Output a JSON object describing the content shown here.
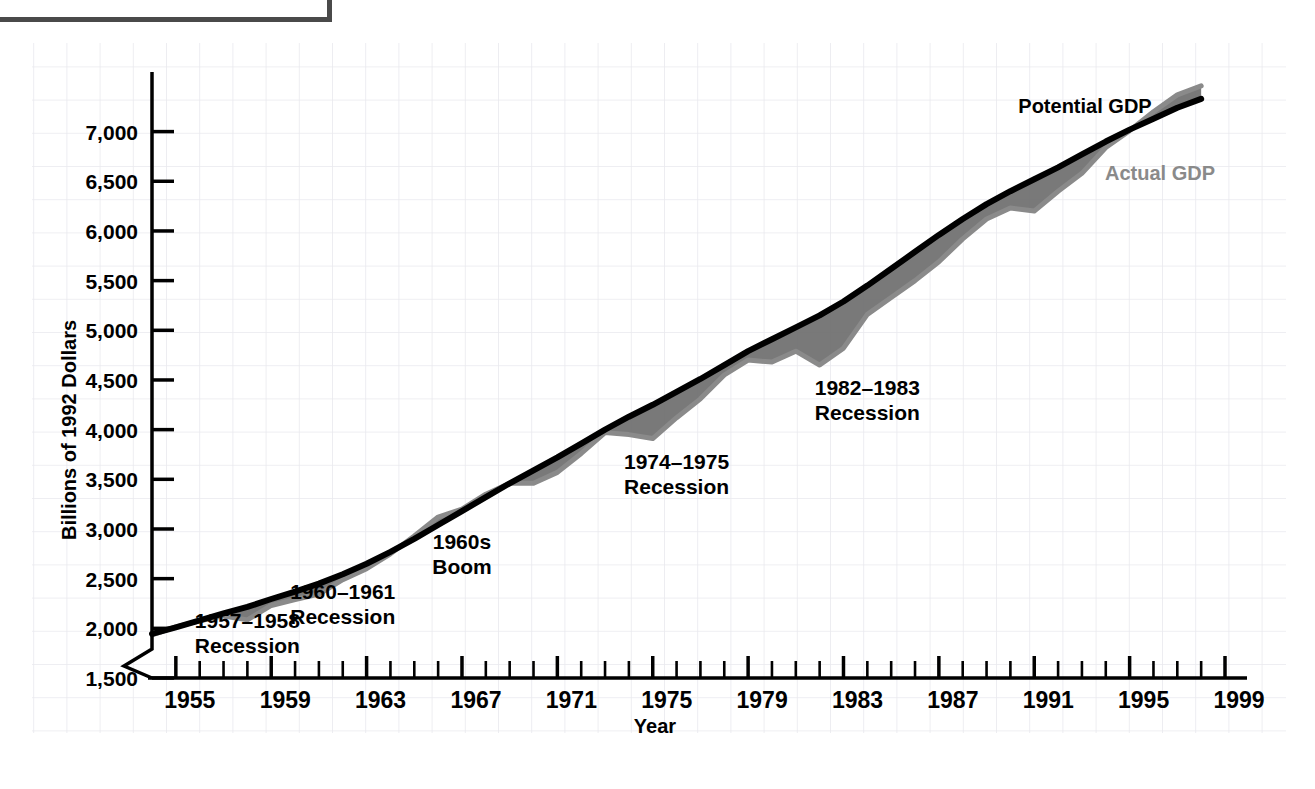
{
  "figure": {
    "background_color": "#ffffff",
    "grid_color": "#e9e9ee",
    "frame_color": "#4a4a4a"
  },
  "chart_data": {
    "type": "line",
    "title": "",
    "subtitle": "",
    "xlabel": "Year",
    "ylabel": "Billions of 1992 Dollars",
    "xlim": [
      1954,
      1999
    ],
    "ylim": [
      1500,
      7600
    ],
    "y_axis_break": true,
    "grid": true,
    "legend_position": "inline-right",
    "x_tick_interval": 1,
    "x_label_interval": 4,
    "y_tick_interval": 500,
    "x_tick_labels": [
      "1955",
      "1959",
      "1963",
      "1967",
      "1971",
      "1975",
      "1979",
      "1983",
      "1987",
      "1991",
      "1995",
      "1999"
    ],
    "y_tick_labels": [
      "1,500",
      "2,000",
      "2,500",
      "3,000",
      "3,500",
      "4,000",
      "4,500",
      "5,000",
      "5,500",
      "6,000",
      "6,500",
      "7,000"
    ],
    "x": [
      1954,
      1955,
      1956,
      1957,
      1958,
      1959,
      1960,
      1961,
      1962,
      1963,
      1964,
      1965,
      1966,
      1967,
      1968,
      1969,
      1970,
      1971,
      1972,
      1973,
      1974,
      1975,
      1976,
      1977,
      1978,
      1979,
      1980,
      1981,
      1982,
      1983,
      1984,
      1985,
      1986,
      1987,
      1988,
      1989,
      1990,
      1991,
      1992,
      1993,
      1994,
      1995,
      1996,
      1997,
      1998
    ],
    "series": [
      {
        "name": "Potential GDP",
        "color": "#000000",
        "values": [
          1945,
          2010,
          2080,
          2150,
          2215,
          2295,
          2370,
          2450,
          2545,
          2650,
          2770,
          2900,
          3040,
          3180,
          3320,
          3460,
          3590,
          3720,
          3860,
          4000,
          4130,
          4250,
          4380,
          4510,
          4650,
          4790,
          4910,
          5030,
          5150,
          5290,
          5450,
          5620,
          5790,
          5960,
          6120,
          6270,
          6400,
          6520,
          6640,
          6770,
          6900,
          7020,
          7130,
          7240,
          7330
        ]
      },
      {
        "name": "Actual GDP",
        "color": "#8a8a8a",
        "values": [
          1935,
          2015,
          2075,
          2125,
          2085,
          2230,
          2290,
          2345,
          2490,
          2600,
          2750,
          2930,
          3120,
          3200,
          3350,
          3460,
          3460,
          3570,
          3760,
          3970,
          3950,
          3910,
          4120,
          4310,
          4550,
          4700,
          4680,
          4790,
          4650,
          4820,
          5160,
          5330,
          5500,
          5690,
          5920,
          6120,
          6230,
          6200,
          6400,
          6580,
          6840,
          7010,
          7200,
          7370,
          7460
        ]
      }
    ],
    "annotations": [
      {
        "id": "rec-1957",
        "lines": [
          "1957–1958",
          "Recession"
        ],
        "x": 1958,
        "y": 2000
      },
      {
        "id": "rec-1960",
        "lines": [
          "1960–1961",
          "Recession"
        ],
        "x": 1962,
        "y": 2300
      },
      {
        "id": "boom-1960s",
        "lines": [
          "1960s",
          "Boom"
        ],
        "x": 1967,
        "y": 2800
      },
      {
        "id": "rec-1974",
        "lines": [
          "1974–1975",
          "Recession"
        ],
        "x": 1976,
        "y": 3600
      },
      {
        "id": "rec-1982",
        "lines": [
          "1982–1983",
          "Recession"
        ],
        "x": 1984,
        "y": 4350
      }
    ],
    "legend": [
      {
        "label": "Potential GDP",
        "color": "#000000"
      },
      {
        "label": "Actual GDP",
        "color": "#8a8a8a"
      }
    ]
  }
}
